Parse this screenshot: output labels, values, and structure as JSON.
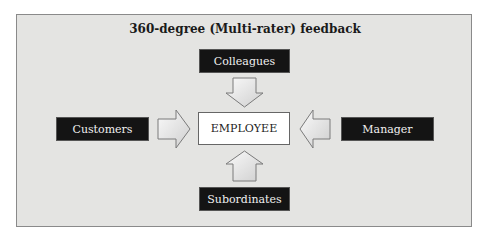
{
  "diagram": {
    "title": "360-degree (Multi-rater) feedback",
    "center": {
      "label": "EMPLOYEE"
    },
    "sources": {
      "top": {
        "label": "Colleagues"
      },
      "left": {
        "label": "Customers"
      },
      "right": {
        "label": "Manager"
      },
      "bottom": {
        "label": "Subordinates"
      }
    },
    "colors": {
      "background": "#e4e4e2",
      "source_box": "#141414",
      "source_text": "#f0f0f0",
      "center_box": "#ffffff",
      "arrow_fill": "#ededed",
      "arrow_stroke": "#7a7a7a"
    }
  }
}
